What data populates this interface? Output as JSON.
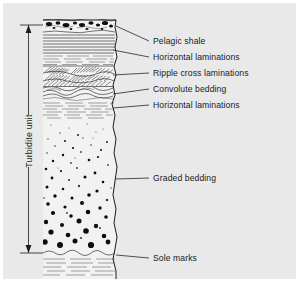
{
  "figure": {
    "background_color": "#e9e9e9",
    "rock_fill_color": "#f2f2f2",
    "ink_color": "#1a1a1a"
  },
  "bracket": {
    "label": "Turbidite unit",
    "orientation": "vertical",
    "arrow_top_y": 22,
    "arrow_bottom_y": 250,
    "icon": "double-headed-arrow-icon"
  },
  "labels": [
    {
      "id": "pelagic-shale",
      "text": "Pelagic shale",
      "x": 150,
      "y": 41,
      "leader_from_x": 113,
      "leader_from_y": 23,
      "leader_to_x": 146,
      "leader_to_y": 38
    },
    {
      "id": "horizontal-laminations-upper",
      "text": "Horizontal laminations",
      "x": 150,
      "y": 57,
      "leader_from_x": 110,
      "leader_from_y": 47,
      "leader_to_x": 146,
      "leader_to_y": 54
    },
    {
      "id": "ripple-cross-laminations",
      "text": "Ripple cross laminations",
      "x": 150,
      "y": 73,
      "leader_from_x": 110,
      "leader_from_y": 72,
      "leader_to_x": 146,
      "leader_to_y": 70
    },
    {
      "id": "convolute-bedding",
      "text": "Convolute bedding",
      "x": 150,
      "y": 89,
      "leader_from_x": 110,
      "leader_from_y": 91,
      "leader_to_x": 146,
      "leader_to_y": 86
    },
    {
      "id": "horizontal-laminations-lower",
      "text": "Horizontal laminations",
      "x": 150,
      "y": 105,
      "leader_from_x": 110,
      "leader_from_y": 105,
      "leader_to_x": 146,
      "leader_to_y": 102
    },
    {
      "id": "graded-bedding",
      "text": "Graded bedding",
      "x": 150,
      "y": 178,
      "leader_from_x": 113,
      "leader_from_y": 176,
      "leader_to_x": 146,
      "leader_to_y": 175
    },
    {
      "id": "sole-marks",
      "text": "Sole marks",
      "x": 150,
      "y": 258,
      "leader_from_x": 113,
      "leader_from_y": 252,
      "leader_to_x": 146,
      "leader_to_y": 255
    }
  ],
  "units": [
    {
      "id": "pelagic-shale-bed",
      "name": "Pelagic shale",
      "top_y": 17,
      "bottom_y": 30,
      "texture": "mud-clasts"
    },
    {
      "id": "upper-horizontal-laminations",
      "name": "Horizontal laminations",
      "top_y": 30,
      "bottom_y": 62,
      "texture": "parallel-lines"
    },
    {
      "id": "ripple-cross-laminated-bed",
      "name": "Ripple cross laminations",
      "top_y": 62,
      "bottom_y": 84,
      "texture": "cross-hatch-sets"
    },
    {
      "id": "convolute-bedded-unit",
      "name": "Convolute bedding",
      "top_y": 84,
      "bottom_y": 98,
      "texture": "wavy-folded-lines"
    },
    {
      "id": "lower-horizontal-laminations",
      "name": "Horizontal laminations",
      "top_y": 98,
      "bottom_y": 116,
      "texture": "dashed-lines"
    },
    {
      "id": "graded-bed",
      "name": "Graded bedding",
      "top_y": 116,
      "bottom_y": 246,
      "texture": "graded-grains"
    },
    {
      "id": "sole-marked-base",
      "name": "Sole marks",
      "top_y": 246,
      "bottom_y": 276,
      "texture": "scoured-base"
    }
  ]
}
